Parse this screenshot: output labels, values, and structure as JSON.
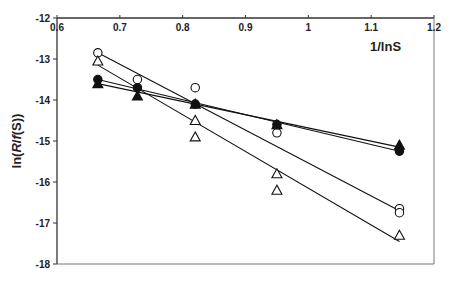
{
  "chart_data": {
    "type": "scatter",
    "title": "",
    "xlabel": "1/lnS",
    "ylabel": "ln(R/f(S))",
    "xlim": [
      0.6,
      1.2
    ],
    "ylim": [
      -18,
      -12
    ],
    "x_ticks": [
      0.6,
      0.7,
      0.8,
      0.9,
      1,
      1.1,
      1.2
    ],
    "x_tick_labels": [
      "0.6",
      "0.7",
      "0.8",
      "0.9",
      "1",
      "1.1",
      "1.2"
    ],
    "y_ticks": [
      -12,
      -13,
      -14,
      -15,
      -16,
      -17,
      -18
    ],
    "y_tick_labels": [
      "-12",
      "-13",
      "-14",
      "-15",
      "-16",
      "-17",
      "-18"
    ],
    "x_axis_position": "top",
    "grid": false,
    "legend": null,
    "series": [
      {
        "name": "open-circles",
        "marker": "circle-open",
        "points": [
          [
            0.665,
            -12.85
          ],
          [
            0.728,
            -13.5
          ],
          [
            0.82,
            -13.7
          ],
          [
            0.95,
            -14.8
          ],
          [
            1.145,
            -16.65
          ],
          [
            1.145,
            -16.75
          ]
        ],
        "fit_line": [
          [
            0.665,
            -12.85
          ],
          [
            1.145,
            -16.7
          ]
        ]
      },
      {
        "name": "open-triangles",
        "marker": "triangle-open",
        "points": [
          [
            0.665,
            -13.05
          ],
          [
            0.82,
            -14.5
          ],
          [
            0.82,
            -14.9
          ],
          [
            0.95,
            -15.8
          ],
          [
            0.95,
            -16.2
          ],
          [
            1.145,
            -17.3
          ]
        ],
        "fit_line": [
          [
            0.665,
            -13.15
          ],
          [
            1.145,
            -17.45
          ]
        ]
      },
      {
        "name": "filled-circles",
        "marker": "circle-filled",
        "points": [
          [
            0.665,
            -13.5
          ],
          [
            0.728,
            -13.7
          ],
          [
            0.82,
            -14.1
          ],
          [
            0.95,
            -14.6
          ],
          [
            1.145,
            -15.25
          ]
        ],
        "fit_line": [
          [
            0.665,
            -13.5
          ],
          [
            1.145,
            -15.25
          ]
        ]
      },
      {
        "name": "filled-triangles",
        "marker": "triangle-filled",
        "points": [
          [
            0.665,
            -13.6
          ],
          [
            0.728,
            -13.9
          ],
          [
            0.82,
            -14.1
          ],
          [
            0.95,
            -14.6
          ],
          [
            1.145,
            -15.1
          ]
        ],
        "fit_line": [
          [
            0.665,
            -13.6
          ],
          [
            1.145,
            -15.15
          ]
        ]
      }
    ]
  },
  "plot_area": {
    "left": 57,
    "top": 18,
    "right": 434,
    "bottom": 264
  }
}
